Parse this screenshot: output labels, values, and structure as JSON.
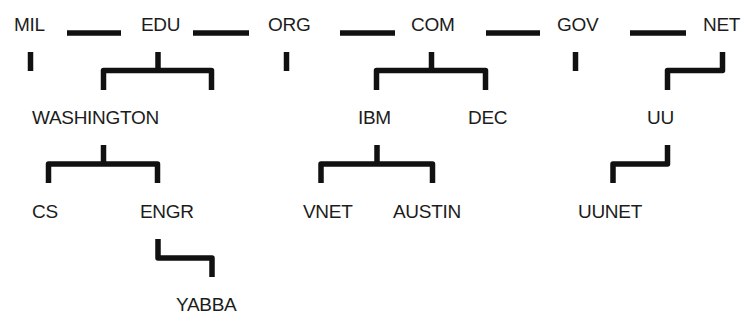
{
  "diagram": {
    "type": "domain-name-hierarchy",
    "line_color": "#111111",
    "text_color": "#1c1c1c",
    "top_level": [
      {
        "label": "MIL",
        "x": 14,
        "y": 15
      },
      {
        "label": "EDU",
        "x": 141,
        "y": 15
      },
      {
        "label": "ORG",
        "x": 268,
        "y": 15
      },
      {
        "label": "COM",
        "x": 411,
        "y": 15
      },
      {
        "label": "GOV",
        "x": 557,
        "y": 15
      },
      {
        "label": "NET",
        "x": 703,
        "y": 15
      }
    ],
    "second_level": [
      {
        "label": "WASHINGTON",
        "parent": "EDU",
        "x": 32,
        "y": 108
      },
      {
        "label": "IBM",
        "parent": "COM",
        "x": 358,
        "y": 108
      },
      {
        "label": "DEC",
        "parent": "COM",
        "x": 468,
        "y": 108
      },
      {
        "label": "UU",
        "parent": "NET",
        "x": 647,
        "y": 108
      }
    ],
    "third_level": [
      {
        "label": "CS",
        "parent": "WASHINGTON",
        "x": 32,
        "y": 202
      },
      {
        "label": "ENGR",
        "parent": "WASHINGTON",
        "x": 140,
        "y": 202
      },
      {
        "label": "VNET",
        "parent": "IBM",
        "x": 303,
        "y": 202
      },
      {
        "label": "AUSTIN",
        "parent": "IBM",
        "x": 393,
        "y": 202
      },
      {
        "label": "UUNET",
        "parent": "UU",
        "x": 578,
        "y": 202
      }
    ],
    "fourth_level": [
      {
        "label": "YABBA",
        "parent": "ENGR",
        "x": 176,
        "y": 295
      }
    ],
    "separators": [
      {
        "between": [
          "MIL",
          "EDU"
        ],
        "x1": 67,
        "x2": 121,
        "y": 33
      },
      {
        "between": [
          "EDU",
          "ORG"
        ],
        "x1": 193,
        "x2": 249,
        "y": 33
      },
      {
        "between": [
          "ORG",
          "COM"
        ],
        "x1": 340,
        "x2": 395,
        "y": 33
      },
      {
        "between": [
          "COM",
          "GOV"
        ],
        "x1": 486,
        "x2": 540,
        "y": 33
      },
      {
        "between": [
          "GOV",
          "NET"
        ],
        "x1": 630,
        "x2": 686,
        "y": 33
      }
    ]
  }
}
